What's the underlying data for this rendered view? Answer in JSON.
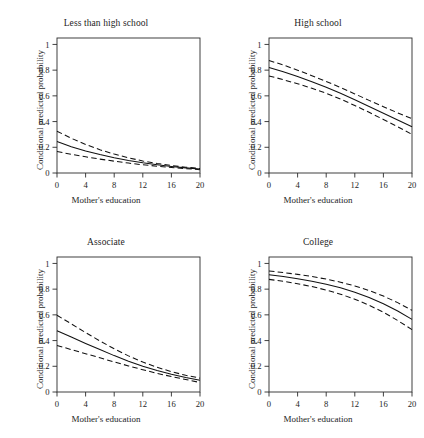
{
  "figure": {
    "layout": "2x2 grid of line plots with confidence bands",
    "background_color": "#ffffff",
    "line_color": "#111111"
  },
  "axes": {
    "xlabel": "Mother's education",
    "ylabel": "Conditional predicted probability",
    "xticks": [
      "0",
      "4",
      "8",
      "12",
      "16",
      "20"
    ],
    "yticks": [
      "0",
      "0.2",
      "0.4",
      "0.6",
      "0.8",
      "1"
    ]
  },
  "chart_data": [
    {
      "type": "line",
      "title": "Less than high school",
      "xlabel": "Mother's education",
      "ylabel": "Conditional predicted probability",
      "xlim": [
        0,
        20
      ],
      "ylim": [
        0,
        1.05
      ],
      "xticks": [
        0,
        4,
        8,
        12,
        16,
        20
      ],
      "yticks": [
        0,
        0.2,
        0.4,
        0.6,
        0.8,
        1
      ],
      "grid": false,
      "legend": "none",
      "x": [
        0,
        2,
        4,
        6,
        8,
        10,
        12,
        14,
        16,
        18,
        20
      ],
      "series": [
        {
          "name": "fit",
          "style": "solid",
          "values": [
            0.245,
            0.205,
            0.172,
            0.143,
            0.118,
            0.097,
            0.079,
            0.064,
            0.051,
            0.04,
            0.031
          ]
        },
        {
          "name": "upper",
          "style": "dashed",
          "values": [
            0.325,
            0.27,
            0.222,
            0.181,
            0.147,
            0.118,
            0.094,
            0.074,
            0.058,
            0.045,
            0.035
          ]
        },
        {
          "name": "lower",
          "style": "dashed",
          "values": [
            0.168,
            0.145,
            0.126,
            0.108,
            0.092,
            0.077,
            0.064,
            0.053,
            0.043,
            0.034,
            0.026
          ]
        }
      ]
    },
    {
      "type": "line",
      "title": "High school",
      "xlabel": "Mother's education",
      "ylabel": "Conditional predicted probability",
      "xlim": [
        0,
        20
      ],
      "ylim": [
        0,
        1.05
      ],
      "xticks": [
        0,
        4,
        8,
        12,
        16,
        20
      ],
      "yticks": [
        0,
        0.2,
        0.4,
        0.6,
        0.8,
        1
      ],
      "grid": false,
      "legend": "none",
      "x": [
        0,
        2,
        4,
        6,
        8,
        10,
        12,
        14,
        16,
        18,
        20
      ],
      "series": [
        {
          "name": "fit",
          "style": "solid",
          "values": [
            0.82,
            0.787,
            0.75,
            0.71,
            0.667,
            0.62,
            0.57,
            0.518,
            0.465,
            0.412,
            0.36
          ]
        },
        {
          "name": "upper",
          "style": "dashed",
          "values": [
            0.875,
            0.84,
            0.8,
            0.757,
            0.712,
            0.665,
            0.615,
            0.565,
            0.516,
            0.468,
            0.422
          ]
        },
        {
          "name": "lower",
          "style": "dashed",
          "values": [
            0.755,
            0.726,
            0.694,
            0.659,
            0.62,
            0.575,
            0.525,
            0.472,
            0.416,
            0.36,
            0.3
          ]
        }
      ]
    },
    {
      "type": "line",
      "title": "Associate",
      "xlabel": "Mother's education",
      "ylabel": "Conditional predicted probability",
      "xlim": [
        0,
        20
      ],
      "ylim": [
        0,
        1.05
      ],
      "xticks": [
        0,
        4,
        8,
        12,
        16,
        20
      ],
      "yticks": [
        0,
        0.2,
        0.4,
        0.6,
        0.8,
        1
      ],
      "grid": false,
      "legend": "none",
      "x": [
        0,
        2,
        4,
        6,
        8,
        10,
        12,
        14,
        16,
        18,
        20
      ],
      "series": [
        {
          "name": "fit",
          "style": "solid",
          "values": [
            0.477,
            0.428,
            0.378,
            0.33,
            0.283,
            0.24,
            0.201,
            0.167,
            0.138,
            0.113,
            0.092
          ]
        },
        {
          "name": "upper",
          "style": "dashed",
          "values": [
            0.597,
            0.53,
            0.462,
            0.397,
            0.336,
            0.281,
            0.233,
            0.192,
            0.158,
            0.13,
            0.108
          ]
        },
        {
          "name": "lower",
          "style": "dashed",
          "values": [
            0.362,
            0.33,
            0.298,
            0.266,
            0.234,
            0.203,
            0.173,
            0.145,
            0.12,
            0.097,
            0.074
          ]
        }
      ]
    },
    {
      "type": "line",
      "title": "College",
      "xlabel": "Mother's education",
      "ylabel": "Conditional predicted probability",
      "xlim": [
        0,
        20
      ],
      "ylim": [
        0,
        1.05
      ],
      "xticks": [
        0,
        4,
        8,
        12,
        16,
        20
      ],
      "yticks": [
        0,
        0.2,
        0.4,
        0.6,
        0.8,
        1
      ],
      "grid": false,
      "legend": "none",
      "x": [
        0,
        2,
        4,
        6,
        8,
        10,
        12,
        14,
        16,
        18,
        20
      ],
      "series": [
        {
          "name": "fit",
          "style": "solid",
          "values": [
            0.912,
            0.898,
            0.881,
            0.861,
            0.838,
            0.81,
            0.776,
            0.735,
            0.687,
            0.63,
            0.565
          ]
        },
        {
          "name": "upper",
          "style": "dashed",
          "values": [
            0.941,
            0.929,
            0.915,
            0.898,
            0.878,
            0.854,
            0.825,
            0.789,
            0.746,
            0.695,
            0.635
          ]
        },
        {
          "name": "lower",
          "style": "dashed",
          "values": [
            0.876,
            0.861,
            0.842,
            0.82,
            0.793,
            0.761,
            0.722,
            0.675,
            0.62,
            0.556,
            0.485
          ]
        }
      ]
    }
  ]
}
